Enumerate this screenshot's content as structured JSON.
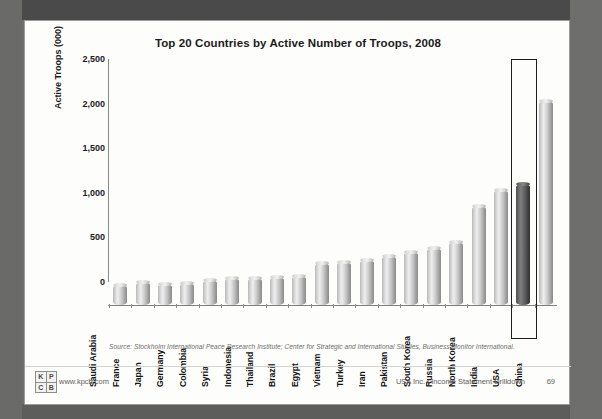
{
  "slide": {
    "title": "Top 20 Countries by Active Number of Troops, 2008",
    "source": "Source: Stockholm International Peace Research Institute; Center for Strategic and International Studies, Business Monitor International.",
    "logo": {
      "l1": "K",
      "l2": "P",
      "l3": "C",
      "l4": "B",
      "url": "www.kpcb.com"
    },
    "footer": {
      "deck": "USA Inc. | Income Statement Drilldown",
      "page": "69"
    }
  },
  "chart_data": {
    "type": "bar",
    "title": "Top 20 Countries by Active Number of Troops, 2008",
    "xlabel": "",
    "ylabel": "Active Troops (000)",
    "ylim": [
      0,
      2500
    ],
    "yticks": [
      "0",
      "500",
      "1,000",
      "1,500",
      "2,000",
      "2,500"
    ],
    "ytick_values": [
      0,
      500,
      1000,
      1500,
      2000,
      2500
    ],
    "grid": false,
    "legend": false,
    "categories": [
      "Saudi Arabia",
      "France",
      "Japan",
      "Germany",
      "Colombia",
      "Syria",
      "Indonesia",
      "Thailand",
      "Brazil",
      "Egypt",
      "Vietnam",
      "Turkey",
      "Iran",
      "Pakistan",
      "South Korea",
      "Russia",
      "North Korea",
      "India",
      "USA",
      "China"
    ],
    "values": [
      225,
      255,
      240,
      245,
      285,
      300,
      300,
      310,
      330,
      470,
      480,
      510,
      545,
      595,
      640,
      710,
      1105,
      1290,
      1360,
      2285
    ],
    "highlight": {
      "category": "USA",
      "value": 1360,
      "style": "dark-bar-with-black-outline-box"
    }
  }
}
